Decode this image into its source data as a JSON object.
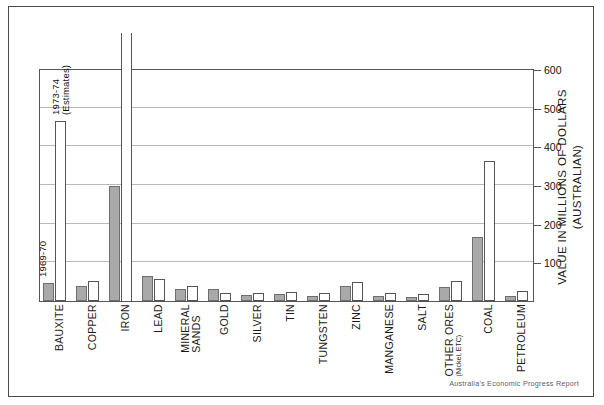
{
  "credit": "Australia's Economic Progress Report",
  "legend": {
    "old_label": "1969-70",
    "new_label_line1": "1973-74",
    "new_label_line2": "(Estimates)"
  },
  "chart_data": {
    "type": "bar",
    "title": "",
    "xlabel": "",
    "ylabel": "VALUE IN MILLIONS OF DOLLARS (AUSTRALIAN)",
    "ylim": [
      0,
      600
    ],
    "yticks": [
      100,
      200,
      300,
      400,
      500,
      600
    ],
    "ytick_labels": [
      "100",
      "200",
      "300",
      "400",
      "500",
      "600"
    ],
    "grid": true,
    "legend_position": "inside-plot-left",
    "categories": [
      "BAUXITE",
      "COPPER",
      "IRON",
      "LEAD",
      "MINERAL SANDS",
      "GOLD",
      "SILVER",
      "TIN",
      "TUNGSTEN",
      "ZINC",
      "MANGANESE",
      "SALT",
      "OTHER ORES",
      "COAL",
      "PETROLEUM"
    ],
    "category_sublabels": [
      "",
      "",
      "",
      "",
      "",
      "",
      "",
      "",
      "",
      "",
      "",
      "",
      "(Nickel, ETC)",
      "",
      ""
    ],
    "series": [
      {
        "name": "1969-70",
        "color": "#a9a9a9",
        "values": [
          47,
          38,
          297,
          65,
          32,
          30,
          16,
          18,
          14,
          38,
          13,
          10,
          35,
          165,
          14
        ]
      },
      {
        "name": "1973-74 (Estimates)",
        "color": "#ffffff",
        "values": [
          465,
          52,
          660,
          57,
          40,
          22,
          22,
          24,
          20,
          48,
          20,
          18,
          52,
          362,
          25
        ],
        "notes": [
          "",
          "",
          "off-scale above 600",
          "",
          "",
          "",
          "",
          "",
          "",
          "",
          "",
          "",
          "",
          "",
          ""
        ]
      }
    ]
  }
}
